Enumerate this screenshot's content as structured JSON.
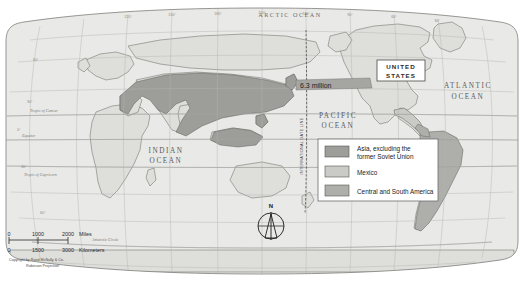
{
  "map": {
    "title_visible": false,
    "projection_note": "Robinson Projection",
    "copyright": "Copyright by Rand McNally & Co.",
    "ocean_labels": [
      {
        "name": "arctic-ocean",
        "text": "ARCTIC OCEAN",
        "x": 290,
        "y": 16
      },
      {
        "name": "pacific-ocean-line1",
        "text": "PACIFIC",
        "x": 338,
        "y": 118
      },
      {
        "name": "pacific-ocean-line2",
        "text": "OCEAN",
        "x": 338,
        "y": 128
      },
      {
        "name": "atlantic-ocean-line1",
        "text": "ATLANTIC",
        "x": 462,
        "y": 88
      },
      {
        "name": "atlantic-ocean-line2",
        "text": "OCEAN",
        "x": 462,
        "y": 99
      },
      {
        "name": "indian-ocean-line1",
        "text": "INDIAN",
        "x": 166,
        "y": 152
      },
      {
        "name": "indian-ocean-line2",
        "text": "OCEAN",
        "x": 166,
        "y": 162
      }
    ],
    "country_label": {
      "text_line1": "UNITED",
      "text_line2": "STATES"
    },
    "callout": {
      "text": "6.3 million"
    },
    "dateline": {
      "text": "INTERNATIONAL DATE LINE"
    },
    "latitude_lines": [
      {
        "label": "Tropic of Cancer",
        "x": 30,
        "y": 98
      },
      {
        "label": "Equator",
        "x": 22,
        "y": 140
      },
      {
        "label": "Tropic of Capricorn",
        "x": 26,
        "y": 178
      },
      {
        "label": "Antarctic Circle",
        "x": 100,
        "y": 237
      }
    ],
    "latitude_ticks": [
      {
        "label": "60°",
        "x": 36,
        "y": 62
      },
      {
        "label": "30°",
        "x": 30,
        "y": 92
      },
      {
        "label": "0°",
        "x": 20,
        "y": 137
      },
      {
        "label": "30°",
        "x": 24,
        "y": 172
      },
      {
        "label": "60°",
        "x": 44,
        "y": 214
      }
    ],
    "longitude_ticks": [
      {
        "label": "120°",
        "x": 128,
        "y": 16
      },
      {
        "label": "150°",
        "x": 173,
        "y": 14
      },
      {
        "label": "180°",
        "x": 218,
        "y": 13
      },
      {
        "label": "150°",
        "x": 262,
        "y": 13
      },
      {
        "label": "120°",
        "x": 306,
        "y": 13
      },
      {
        "label": "90°",
        "x": 350,
        "y": 14
      },
      {
        "label": "60°",
        "x": 394,
        "y": 16
      },
      {
        "label": "30°",
        "x": 436,
        "y": 19
      }
    ],
    "compass": {
      "label": "N"
    }
  },
  "legend": {
    "items": [
      {
        "name": "legend-asia",
        "label_line1": "Asia, excluding the",
        "label_line2": "former Soviet Union",
        "color": "#9b9b99"
      },
      {
        "name": "legend-mexico",
        "label_line1": "Mexico",
        "label_line2": "",
        "color": "#c9c9c6"
      },
      {
        "name": "legend-central-south-america",
        "label_line1": "Central and South America",
        "label_line2": "",
        "color": "#adadaa"
      }
    ],
    "box_fill": "#ffffff",
    "box_stroke": "#6d6d6b"
  },
  "scale": {
    "miles": {
      "ticks": [
        "0",
        "1000",
        "2000"
      ],
      "unit": "Miles"
    },
    "kilometers": {
      "ticks": [
        "0",
        "1500",
        "3000"
      ],
      "unit": "Kilometers"
    },
    "copyright_line1": "Copyright by Rand McNally & Co.",
    "copyright_line2": "Robinson Projection"
  },
  "colors": {
    "map_background": "#ffffff",
    "ocean_fill": "#e8e8e6",
    "land_fill": "#dcdcd9",
    "shade_asia": "#9b9b99",
    "shade_mexico": "#c9c9c6",
    "shade_south_america": "#adadaa",
    "graticule": "#b4b4b0",
    "coastline": "#4a4a48",
    "frame": "#7a7a77"
  }
}
